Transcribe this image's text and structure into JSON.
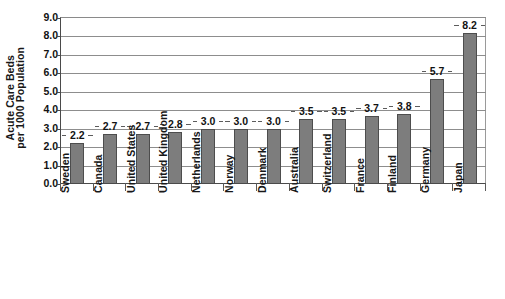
{
  "chart_data": {
    "type": "bar",
    "title": "",
    "subtitle": "",
    "xlabel": "",
    "ylabel": "Acute Care Beds per 1000 Population",
    "ylabel_lines": [
      "Acute Care Beds",
      "per 1000 Population"
    ],
    "categories": [
      "Sweden",
      "Canada",
      "United States",
      "United Kingdom",
      "Netherlands",
      "Norway",
      "Denmark",
      "Australia",
      "Switzerland",
      "France",
      "Finland",
      "Germany",
      "Japan"
    ],
    "values": [
      2.2,
      2.7,
      2.7,
      2.8,
      3.0,
      3.0,
      3.0,
      3.5,
      3.5,
      3.7,
      3.8,
      5.7,
      8.2
    ],
    "data_labels": [
      "2.2",
      "2.7",
      "2.7",
      "2.8",
      "3.0",
      "3.0",
      "3.0",
      "3.5",
      "3.5",
      "3.7",
      "3.8",
      "5.7",
      "8.2"
    ],
    "ylim": [
      0.0,
      9.0
    ],
    "ytick_step": 1.0,
    "ytick_labels": [
      "9.0",
      "8.0",
      "7.0",
      "6.0",
      "5.0",
      "4.0",
      "3.0",
      "2.0",
      "1.0",
      "0.0"
    ],
    "ytick_values": [
      9.0,
      8.0,
      7.0,
      6.0,
      5.0,
      4.0,
      3.0,
      2.0,
      1.0,
      0.0
    ],
    "grid": true,
    "grid_axis": "y",
    "legend": false,
    "legend_position": "none",
    "bar_color": "#7d7d7d",
    "bar_border_color": "#4d4d4d",
    "grid_color": "#8d8d8d",
    "axis_color": "#4a4a4a",
    "text_color": "#121212",
    "background": "#ffffff",
    "xlabel_rotation": 90
  }
}
